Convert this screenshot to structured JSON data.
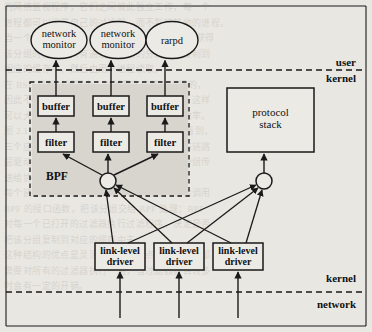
{
  "diagram": {
    "colors": {
      "background": "#e9e7e2",
      "shade": "#d6d3cc",
      "stroke": "#1a1a1a",
      "box_fill": "#eceae5"
    },
    "user_processes": [
      {
        "id": "proc-1",
        "line1": "network",
        "line2": "monitor"
      },
      {
        "id": "proc-2",
        "line1": "network",
        "line2": "monitor"
      },
      {
        "id": "proc-3",
        "line1": "rarpd",
        "line2": ""
      }
    ],
    "buffers": [
      {
        "id": "buffer-1",
        "label": "buffer"
      },
      {
        "id": "buffer-2",
        "label": "buffer"
      },
      {
        "id": "buffer-3",
        "label": "buffer"
      }
    ],
    "filters": [
      {
        "id": "filter-1",
        "label": "filter"
      },
      {
        "id": "filter-2",
        "label": "filter"
      },
      {
        "id": "filter-3",
        "label": "filter"
      }
    ],
    "bpf_label": "BPF",
    "protocol_stack": {
      "line1": "protocol",
      "line2": "stack"
    },
    "drivers": [
      {
        "id": "driver-1",
        "line1": "link-level",
        "line2": "driver"
      },
      {
        "id": "driver-2",
        "line1": "link-level",
        "line2": "driver"
      },
      {
        "id": "driver-3",
        "line1": "link-level",
        "line2": "driver"
      }
    ],
    "boundaries": [
      {
        "id": "boundary-upper",
        "above": "user",
        "below": "kernel"
      },
      {
        "id": "boundary-lower",
        "above": "kernel",
        "below": "network"
      }
    ]
  },
  "background_text": {
    "lines": [
      "的网络监视程序，它们之间彼此独立工作，每一个",
      "进程都可以设置自己的过滤器，而不影响其他的进程。",
      "当一个分组到达时，内核中的 BPF 先于协议栈获得",
      "该分组的副本，只有通过过滤器的分组才被复制到",
      "相应的缓存中，然后由用户进程读取。",
      "",
      "在 BSD 分组过滤器中，过滤是在内核中进行的，",
      "因此不需要把所有的分组都复制到用户空间，这样",
      "可以大大减少数据的复制量，提高了捕获的效率。",
      "",
      "图 2.1 给出了 BPF 的体系结构。从图中可以看到，",
      "三个应用程序分别通过各自的过滤器和缓存与链路",
      "层驱动程序相连，同时链路层驱动程序还把分组传",
      "送给协议栈进行正常的协议处理。",
      "",
      "每个链路层驱动程序在收到一个分组后，都会调用",
      "BPF 的接口函数，把该分组交给 BPF 处理；BPF",
      "对每一个已打开的过滤器执行过滤程序，决定是否",
      "把该分组复制到对应的缓存中去。",
      "",
      "这种结构的优点是灵活、高效，缺点是每个分组都",
      "需要对所有的过滤器执行一遍，当过滤器数目较多",
      "时会有一定的开销。"
    ]
  }
}
